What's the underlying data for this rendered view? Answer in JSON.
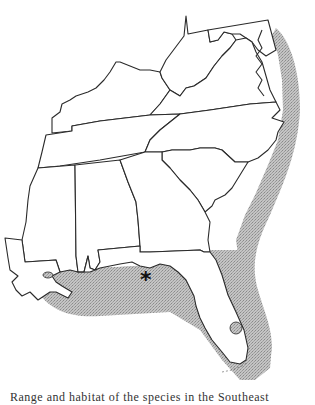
{
  "map": {
    "title": "Range map, southeastern United States",
    "region": "Southeastern United States",
    "range_fill_color": "#b5b5b5",
    "outline_color": "#2a2a2a",
    "background": "#ffffff",
    "range_description": "Shaded coastal marine range along the Atlantic coast from the Delmarva Peninsula south to Florida, around the Florida peninsula and Keys, and along the Gulf coast west to Louisiana",
    "marker": {
      "symbol": "*",
      "meaning": "locality marker",
      "location": "Florida Panhandle coast (Apalachicola area)"
    },
    "states_shown": [
      "Kentucky",
      "West Virginia",
      "Maryland",
      "Delaware",
      "Virginia",
      "Tennessee",
      "North Carolina",
      "South Carolina",
      "Mississippi",
      "Alabama",
      "Georgia",
      "Louisiana",
      "Florida"
    ]
  },
  "caption": {
    "text": "Range and habitat of the species in the Southeast"
  }
}
